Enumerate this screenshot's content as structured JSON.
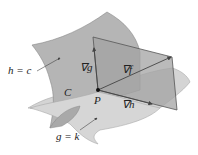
{
  "diagram": {
    "type": "lagrange-multipliers-two-constraints",
    "colors": {
      "surface_h": "#b5b5b5",
      "surface_g": "#d4d4d4",
      "tangent_plane": "#a3a3a3",
      "stroke": "#555555",
      "text": "#222222"
    },
    "labels": {
      "surface_h": "h = c",
      "surface_g": "g = k",
      "curve": "C",
      "point": "P",
      "grad_g": "∇g",
      "grad_f": "∇f",
      "grad_h": "∇h"
    }
  }
}
